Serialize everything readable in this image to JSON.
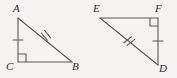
{
  "figure": {
    "kind": "geometry-diagram",
    "background_color": "#f4f3f1",
    "stroke_color": "#5a5a5a",
    "label_color": "#2b2b2b",
    "stroke_width": 1.1
  },
  "shapes": [
    {
      "name": "triangle-abc",
      "vertices": [
        {
          "label": "A",
          "x": 18,
          "y": 18,
          "label_x": 13,
          "label_y": 3
        },
        {
          "label": "C",
          "x": 18,
          "y": 62,
          "label_x": 8,
          "label_y": 62
        },
        {
          "label": "B",
          "x": 72,
          "y": 62,
          "label_x": 72,
          "label_y": 62
        }
      ],
      "sides": [
        {
          "name": "side-ac",
          "from": "A",
          "to": "C",
          "ticks": 1
        },
        {
          "name": "side-cb",
          "from": "C",
          "to": "B",
          "ticks": 0
        },
        {
          "name": "side-ab",
          "from": "A",
          "to": "B",
          "ticks": 2
        }
      ],
      "right_angle_at": "C"
    },
    {
      "name": "triangle-efd",
      "vertices": [
        {
          "label": "E",
          "x": 100,
          "y": 18,
          "label_x": 92,
          "label_y": 3
        },
        {
          "label": "F",
          "x": 158,
          "y": 18,
          "label_x": 155,
          "label_y": 3
        },
        {
          "label": "D",
          "x": 158,
          "y": 65,
          "label_x": 159,
          "label_y": 64
        }
      ],
      "sides": [
        {
          "name": "side-ef",
          "from": "E",
          "to": "F",
          "ticks": 0
        },
        {
          "name": "side-fd",
          "from": "F",
          "to": "D",
          "ticks": 1
        },
        {
          "name": "side-ed",
          "from": "E",
          "to": "D",
          "ticks": 2
        }
      ],
      "right_angle_at": "F"
    }
  ],
  "labels": {
    "a": "A",
    "b": "B",
    "c": "C",
    "d": "D",
    "e": "E",
    "f": "F"
  }
}
